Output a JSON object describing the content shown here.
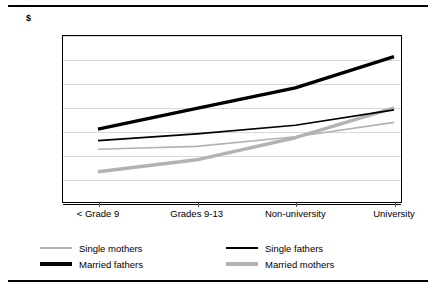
{
  "clipped_title": "",
  "axis": {
    "unit_label": "$",
    "y_ticks": [
      "35,000",
      "30,000",
      "25,000",
      "20,000",
      "15,000",
      "10,000",
      "5,000",
      "0"
    ]
  },
  "legend": {
    "items": [
      {
        "label": "Single mothers",
        "color": "#b3b3b3",
        "width": 1.6
      },
      {
        "label": "Single fathers",
        "color": "#000000",
        "width": 1.6
      },
      {
        "label": "Married fathers",
        "color": "#000000",
        "width": 3.4
      },
      {
        "label": "Married mothers",
        "color": "#b3b3b3",
        "width": 3.4
      }
    ]
  },
  "chart_data": {
    "type": "line",
    "title": "",
    "xlabel": "",
    "ylabel": "$",
    "categories": [
      "< Grade 9",
      "Grades 9-13",
      "Non-university",
      "University"
    ],
    "ylim": [
      0,
      35000
    ],
    "ytick_step": 5000,
    "grid": true,
    "legend_position": "bottom",
    "series": [
      {
        "name": "Single mothers",
        "color": "#b3b3b3",
        "width": 1.6,
        "values": [
          11200,
          11800,
          13800,
          16800
        ]
      },
      {
        "name": "Single fathers",
        "color": "#000000",
        "width": 1.6,
        "values": [
          13000,
          14400,
          16200,
          19400
        ]
      },
      {
        "name": "Married fathers",
        "color": "#000000",
        "width": 3.4,
        "values": [
          15400,
          19700,
          24000,
          30500
        ]
      },
      {
        "name": "Married mothers",
        "color": "#b3b3b3",
        "width": 3.4,
        "values": [
          6500,
          9000,
          13600,
          19800
        ]
      }
    ]
  }
}
